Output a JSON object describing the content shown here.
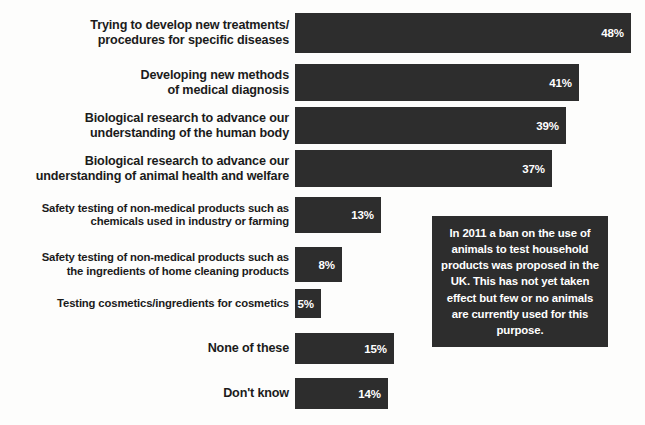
{
  "chart_data": {
    "type": "bar",
    "title": "",
    "subtitle": "",
    "xlabel": "",
    "ylabel": "",
    "orientation": "horizontal",
    "grid": false,
    "legend": false,
    "xlim": [
      0,
      64
    ],
    "value_suffix": "%",
    "bar_color": "#2d2d2d",
    "value_label_color": "#ffffff",
    "background_color": "#fdfdfc",
    "categories": [
      "Trying to develop new treatments/\nprocedures for specific diseases",
      "Developing new methods\nof medical diagnosis",
      "Biological research to advance our\nunderstanding of the human body",
      "Biological research to advance our\nunderstanding of animal health and welfare",
      "Safety testing of non-medical products such as\nchemicals used in industry or farming",
      "Safety testing of non-medical products such as\nthe ingredients of home cleaning products",
      "Testing cosmetics/ingredients for cosmetics",
      "None of these",
      "Don't know"
    ],
    "values": [
      48,
      41,
      39,
      37,
      13,
      8,
      5,
      15,
      14
    ],
    "value_labels": [
      "48%",
      "41%",
      "39%",
      "37%",
      "13%",
      "8%",
      "5%",
      "15%",
      "14%"
    ],
    "annotations": [
      "In 2011 a ban on the use of animals to test household products was proposed in the UK. This has not yet taken effect but few or no animals are currently used for this purpose."
    ]
  },
  "rows": [
    {
      "label_line1": "Trying to develop new treatments/",
      "label_line2": "procedures for specific diseases",
      "value": "48%",
      "size": "lg",
      "top": 13,
      "height": 40,
      "bar_width": 336
    },
    {
      "label_line1": "Developing new methods",
      "label_line2": "of medical diagnosis",
      "value": "41%",
      "size": "lg",
      "top": 64,
      "height": 37,
      "bar_width": 284
    },
    {
      "label_line1": "Biological research to advance our",
      "label_line2": "understanding of the human body",
      "value": "39%",
      "size": "lg",
      "top": 107,
      "height": 37,
      "bar_width": 271
    },
    {
      "label_line1": "Biological research to advance our",
      "label_line2": "understanding of animal health and welfare",
      "value": "37%",
      "size": "lg",
      "top": 150,
      "height": 37,
      "bar_width": 257
    },
    {
      "label_line1": "Safety testing of non-medical products such as",
      "label_line2": "chemicals used in industry or farming",
      "value": "13%",
      "size": "sm",
      "top": 197,
      "height": 36,
      "bar_width": 86
    },
    {
      "label_line1": "Safety testing of non-medical products such as",
      "label_line2": "the ingredients of home cleaning products",
      "value": "8%",
      "size": "sm",
      "top": 247,
      "height": 35,
      "bar_width": 47
    },
    {
      "label_line1": "Testing cosmetics/ingredients for cosmetics",
      "label_line2": "",
      "value": "5%",
      "size": "sm",
      "top": 289,
      "height": 29,
      "bar_width": 26
    },
    {
      "label_line1": "None of these",
      "label_line2": "",
      "value": "15%",
      "size": "lg",
      "top": 333,
      "height": 31,
      "bar_width": 99
    },
    {
      "label_line1": "Don't know",
      "label_line2": "",
      "value": "14%",
      "size": "lg",
      "top": 378,
      "height": 31,
      "bar_width": 93
    }
  ],
  "callout": {
    "text": "In 2011 a ban on the use of animals to test household products was proposed in the UK. This has not yet taken effect but few or no animals are currently used for this purpose.",
    "left": 432,
    "top": 216,
    "width": 176,
    "height": 131
  }
}
